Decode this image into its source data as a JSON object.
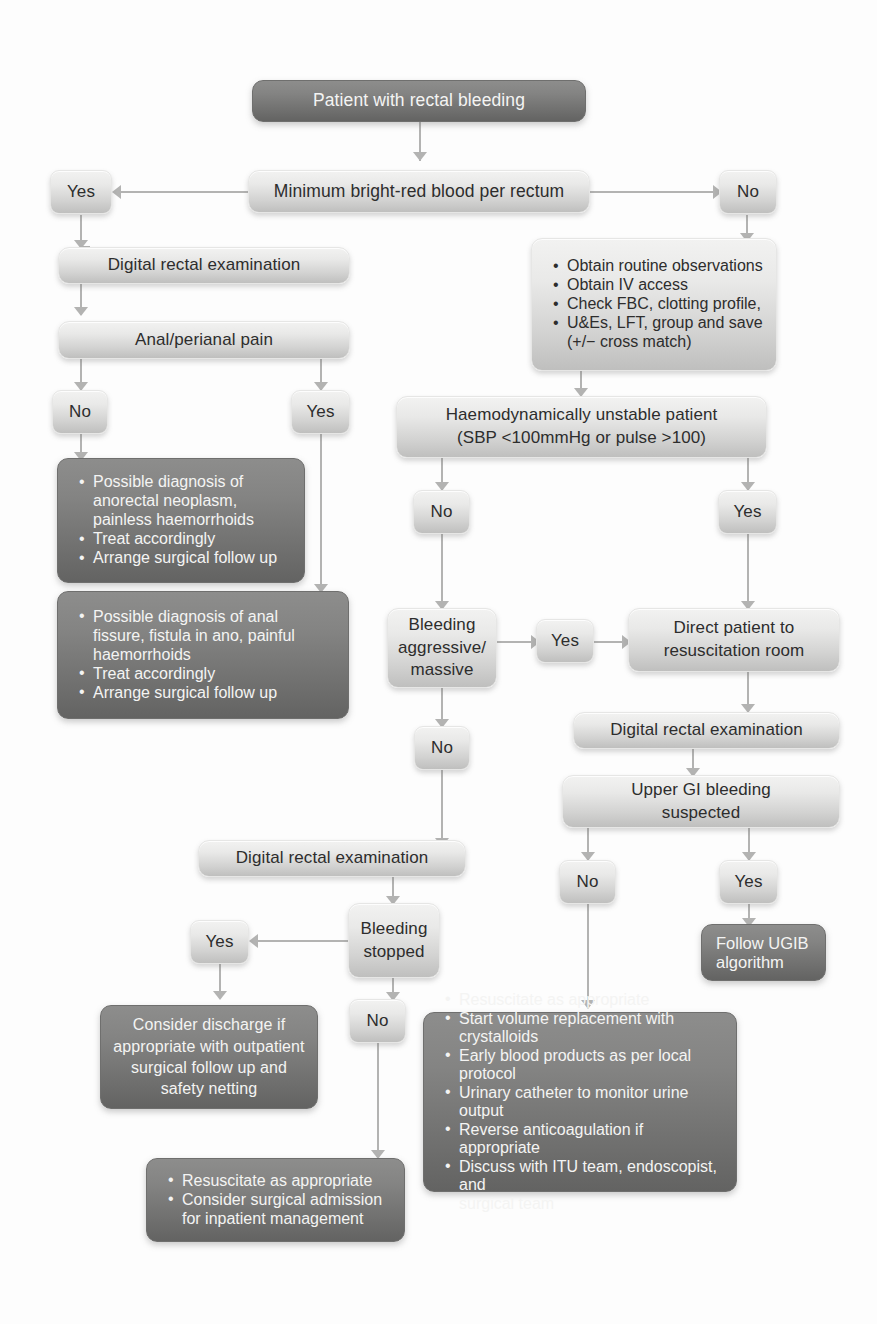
{
  "diagram": {
    "colors": {
      "light_box_top": "#f2f2f1",
      "light_box_bottom": "#bfbfbe",
      "dark_box_top": "#8d8d8c",
      "dark_box_bottom": "#636362",
      "light_text": "#2d2d2d",
      "dark_text": "#f4f4f3",
      "connector": "#b3b3b2"
    },
    "nodes": {
      "start": {
        "label": "Patient with rectal bleeding"
      },
      "min_brb": {
        "label": "Minimum bright-red blood per rectum"
      },
      "yes_min": {
        "label": "Yes"
      },
      "no_min": {
        "label": "No"
      },
      "dre_left": {
        "label": "Digital rectal examination"
      },
      "anal_pain": {
        "label": "Anal/perianal pain"
      },
      "no_pain": {
        "label": "No"
      },
      "yes_pain": {
        "label": "Yes"
      },
      "neoplasm": {
        "lines": [
          "Possible diagnosis of",
          "anorectal neoplasm,",
          "painless haemorrhoids",
          "Treat accordingly",
          "Arrange surgical follow up"
        ],
        "bullets": [
          true,
          false,
          false,
          true,
          true
        ]
      },
      "fissure": {
        "lines": [
          "Possible diagnosis of anal",
          "fissure, fistula in ano, painful",
          "haemorrhoids",
          "Treat accordingly",
          "Arrange surgical follow up"
        ],
        "bullets": [
          true,
          false,
          false,
          true,
          true
        ]
      },
      "initial_obs": {
        "lines": [
          "Obtain routine observations",
          "Obtain IV access",
          "Check FBC, clotting profile,",
          "U&Es, LFT, group and save",
          "(+/− cross match)"
        ],
        "bullets": [
          true,
          true,
          true,
          true,
          false
        ]
      },
      "haemo_unstable": {
        "line1": "Haemodynamically unstable patient",
        "line2": "(SBP <100mmHg or pulse >100)"
      },
      "no_unstable": {
        "label": "No"
      },
      "yes_unstable": {
        "label": "Yes"
      },
      "bleeding_aggressive": {
        "line1": "Bleeding",
        "line2": "aggressive/",
        "line3": "massive"
      },
      "yes_aggressive": {
        "label": "Yes"
      },
      "no_aggressive": {
        "label": "No"
      },
      "direct_resus": {
        "line1": "Direct patient to",
        "line2": "resuscitation room"
      },
      "dre_right": {
        "label": "Digital rectal examination"
      },
      "ugib_suspected": {
        "line1": "Upper GI bleeding",
        "line2": "suspected"
      },
      "no_ugib": {
        "label": "No"
      },
      "yes_ugib": {
        "label": "Yes"
      },
      "follow_ugib": {
        "line1": "Follow UGIB",
        "line2": "algorithm"
      },
      "dre_bottom": {
        "label": "Digital rectal examination"
      },
      "bleeding_stopped": {
        "line1": "Bleeding",
        "line2": "stopped"
      },
      "yes_stopped": {
        "label": "Yes"
      },
      "no_stopped": {
        "label": "No"
      },
      "discharge": {
        "line1": "Consider discharge if",
        "line2": "appropriate with outpatient",
        "line3": "surgical follow up and",
        "line4": "safety netting"
      },
      "resus_admission": {
        "lines": [
          "Resuscitate as appropriate",
          "Consider surgical admission",
          "for inpatient management"
        ],
        "bullets": [
          true,
          true,
          false
        ]
      },
      "resus_full": {
        "lines": [
          "Resuscitate as appropriate",
          "Start volume replacement with crystalloids",
          "Early blood products as per local protocol",
          "Urinary catheter to monitor urine output",
          "Reverse anticoagulation if appropriate",
          "Discuss with ITU team, endoscopist, and",
          "surgical team"
        ],
        "bullets": [
          true,
          true,
          true,
          true,
          true,
          true,
          false
        ]
      }
    }
  }
}
